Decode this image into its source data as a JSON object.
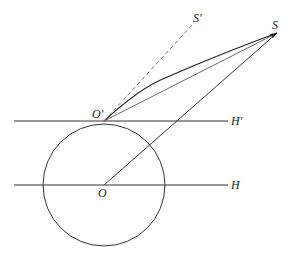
{
  "diagram": {
    "labels": {
      "S": "S",
      "S_prime": "S'",
      "O": "O",
      "O_prime": "O'",
      "H": "H",
      "H_prime": "H'"
    },
    "stroke_color": "#333333",
    "dashed_color": "#777777"
  }
}
